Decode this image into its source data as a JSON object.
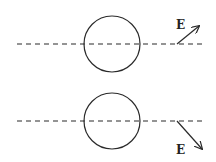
{
  "diagram": {
    "panels": [
      {
        "name": "top",
        "axis_y": 44,
        "circle": {
          "cx": 112,
          "cy": 44,
          "r": 28
        },
        "field_vector": {
          "label": "E",
          "direction": "up-right",
          "x1": 177,
          "y1": 44,
          "x2": 199,
          "y2": 26,
          "label_x": 176,
          "label_y": 29
        }
      },
      {
        "name": "bottom",
        "axis_y": 121,
        "circle": {
          "cx": 112,
          "cy": 121,
          "r": 28
        },
        "field_vector": {
          "label": "E",
          "direction": "down-right",
          "x1": 177,
          "y1": 121,
          "x2": 202,
          "y2": 149,
          "label_x": 176,
          "label_y": 154
        }
      }
    ],
    "axis": {
      "x_start": 17,
      "x_end": 206
    },
    "colors": {
      "stroke": "#2a2a2a",
      "background": "#ffffff"
    }
  }
}
